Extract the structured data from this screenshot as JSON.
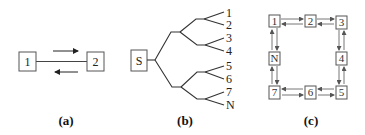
{
  "figure": {
    "panels": [
      {
        "id": "a",
        "caption": "(a)",
        "nodes": [
          "1",
          "2"
        ],
        "description": "Two nodes connected by a line with bidirectional arrows"
      },
      {
        "id": "b",
        "caption": "(b)",
        "root": "S",
        "leaves": [
          "1",
          "2",
          "3",
          "4",
          "5",
          "6",
          "7",
          "N"
        ],
        "description": "Binary tree from source S to leaves 1..N"
      },
      {
        "id": "c",
        "caption": "(c)",
        "nodes": [
          "1",
          "2",
          "3",
          "4",
          "5",
          "6",
          "7",
          "N"
        ],
        "description": "Ring of nodes with bidirectional arrows between neighbors"
      }
    ]
  },
  "colors": {
    "stroke": "#444444",
    "text": "#222222",
    "background": "#ffffff"
  }
}
